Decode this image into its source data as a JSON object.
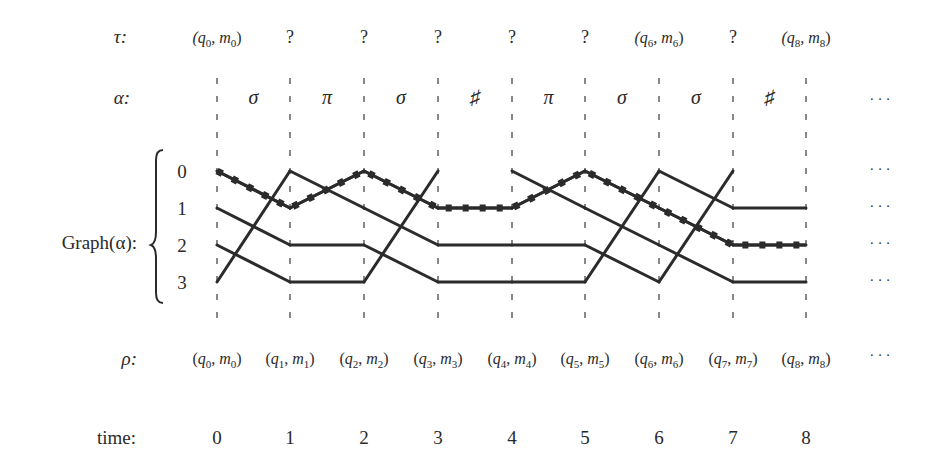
{
  "figure": {
    "row_labels": {
      "tau": "τ:",
      "alpha": "α:",
      "graph": "Graph(α):",
      "rho": "ρ:",
      "time": "time:"
    },
    "tau": [
      {
        "t": 0,
        "text": "(q",
        "sub": "0",
        "text2": ", m",
        "sub2": "0",
        "text3": ")"
      },
      {
        "t": 1,
        "text": "?"
      },
      {
        "t": 2,
        "text": "?"
      },
      {
        "t": 3,
        "text": "?"
      },
      {
        "t": 4,
        "text": "?"
      },
      {
        "t": 5,
        "text": "?"
      },
      {
        "t": 6,
        "text": "(q",
        "sub": "6",
        "text2": ", m",
        "sub2": "6",
        "text3": ")"
      },
      {
        "t": 7,
        "text": "?"
      },
      {
        "t": 8,
        "text": "(q",
        "sub": "8",
        "text2": ", m",
        "sub2": "8",
        "text3": ")"
      }
    ],
    "alpha": [
      "σ",
      "π",
      "σ",
      "♯",
      "π",
      "σ",
      "σ",
      "♯"
    ],
    "alpha_ellipsis": "· · ·",
    "graph_rows": [
      "0",
      "1",
      "2",
      "3"
    ],
    "graph_ellipsis": "· · ·",
    "rho": [
      {
        "q": "q",
        "qs": "0",
        "m": "m",
        "ms": "0"
      },
      {
        "q": "q",
        "qs": "1",
        "m": "m",
        "ms": "1"
      },
      {
        "q": "q",
        "qs": "2",
        "m": "m",
        "ms": "2"
      },
      {
        "q": "q",
        "qs": "3",
        "m": "m",
        "ms": "3"
      },
      {
        "q": "q",
        "qs": "4",
        "m": "m",
        "ms": "4"
      },
      {
        "q": "q",
        "qs": "5",
        "m": "m",
        "ms": "5"
      },
      {
        "q": "q",
        "qs": "6",
        "m": "m",
        "ms": "6"
      },
      {
        "q": "q",
        "qs": "7",
        "m": "m",
        "ms": "7"
      },
      {
        "q": "q",
        "qs": "8",
        "m": "m",
        "ms": "8"
      }
    ],
    "rho_ellipsis": "· · ·",
    "time": [
      "0",
      "1",
      "2",
      "3",
      "4",
      "5",
      "6",
      "7",
      "8"
    ],
    "edges": [
      [
        [
          0,
          1
        ],
        [
          1,
          2
        ],
        [
          2,
          3
        ],
        [
          3,
          0
        ]
      ],
      [
        [
          0,
          1
        ],
        [
          1,
          0
        ],
        [
          2,
          2
        ],
        [
          3,
          3
        ]
      ],
      [
        [
          0,
          1
        ],
        [
          1,
          2
        ],
        [
          2,
          3
        ],
        [
          3,
          0
        ]
      ],
      [
        [
          1,
          1
        ],
        [
          2,
          2
        ],
        [
          3,
          3
        ]
      ],
      [
        [
          0,
          1
        ],
        [
          1,
          0
        ],
        [
          2,
          2
        ],
        [
          3,
          3
        ]
      ],
      [
        [
          0,
          1
        ],
        [
          1,
          2
        ],
        [
          2,
          3
        ],
        [
          3,
          0
        ]
      ],
      [
        [
          0,
          1
        ],
        [
          1,
          2
        ],
        [
          2,
          3
        ],
        [
          3,
          0
        ]
      ],
      [
        [
          1,
          1
        ],
        [
          2,
          2
        ],
        [
          3,
          3
        ]
      ]
    ],
    "highlighted_run": [
      0,
      1,
      0,
      1,
      1,
      0,
      1,
      2,
      2
    ],
    "colors": {
      "ink": "#2b2b2b",
      "background": "#ffffff"
    }
  }
}
